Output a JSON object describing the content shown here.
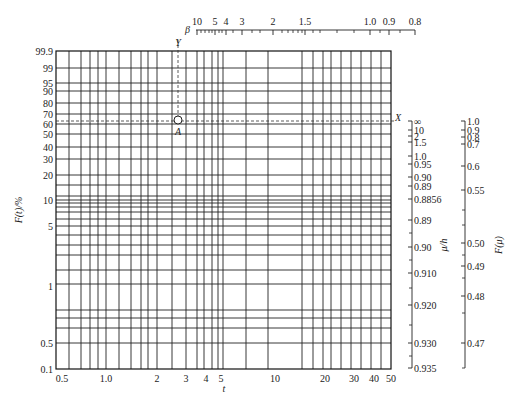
{
  "chart_data": {
    "type": "weibull_probability_paper",
    "title": "",
    "plot_area": {
      "left": 56,
      "right": 391,
      "top": 51,
      "bottom": 369
    },
    "xlabel": "t",
    "ylabel": "F(t)/%",
    "x_axis": {
      "scale": "log",
      "range": [
        0.5,
        50
      ],
      "tick_labels": [
        {
          "label": "0.5",
          "x": 62
        },
        {
          "label": "1.0",
          "x": 106
        },
        {
          "label": "2",
          "x": 157
        },
        {
          "label": "3",
          "x": 186
        },
        {
          "label": "4",
          "x": 206
        },
        {
          "label": "5",
          "x": 221
        },
        {
          "label": "10",
          "x": 275
        },
        {
          "label": "20",
          "x": 325
        },
        {
          "label": "30",
          "x": 354
        },
        {
          "label": "40",
          "x": 374
        },
        {
          "label": "50",
          "x": 391
        }
      ],
      "grid_x": [
        69,
        81,
        90,
        98,
        106,
        119,
        131,
        141,
        148,
        157,
        172,
        186,
        197,
        204,
        212,
        218,
        223,
        246,
        268,
        302,
        313,
        323,
        331,
        341,
        351,
        361,
        371,
        381
      ]
    },
    "y_axis": {
      "scale": "weibull",
      "tick_labels": [
        {
          "label": "99.9",
          "y": 51
        },
        {
          "label": "99",
          "y": 68
        },
        {
          "label": "95",
          "y": 83
        },
        {
          "label": "90",
          "y": 91
        },
        {
          "label": "80",
          "y": 103
        },
        {
          "label": "70",
          "y": 114
        },
        {
          "label": "60",
          "y": 124
        },
        {
          "label": "50",
          "y": 134
        },
        {
          "label": "40",
          "y": 147
        },
        {
          "label": "30",
          "y": 159
        },
        {
          "label": "20",
          "y": 175
        },
        {
          "label": "10",
          "y": 200
        },
        {
          "label": "5",
          "y": 226
        },
        {
          "label": "1",
          "y": 286
        },
        {
          "label": "0.5",
          "y": 343
        },
        {
          "label": "0.1",
          "y": 369
        }
      ],
      "grid_y": [
        68,
        83,
        91,
        103,
        114,
        124,
        134,
        147,
        159,
        175,
        185,
        196,
        200,
        203,
        207,
        212,
        219,
        226,
        235,
        245,
        255,
        270,
        284,
        310,
        318,
        328,
        343
      ]
    },
    "beta_scale": {
      "label": "β",
      "y": 30,
      "x_start": 196,
      "x_end": 415,
      "tick_labels": [
        {
          "label": "10",
          "x": 197
        },
        {
          "label": "5",
          "x": 215
        },
        {
          "label": "4",
          "x": 226
        },
        {
          "label": "3",
          "x": 242
        },
        {
          "label": "2",
          "x": 273
        },
        {
          "label": "1.5",
          "x": 305
        },
        {
          "label": "1.0",
          "x": 370
        },
        {
          "label": "0.9",
          "x": 389
        },
        {
          "label": "0.8",
          "x": 415
        }
      ],
      "minor_ticks": [
        201,
        205,
        209,
        212,
        219,
        222,
        233,
        252,
        260,
        282,
        288,
        293,
        298,
        302,
        313,
        320,
        337,
        354,
        380,
        400
      ]
    },
    "mu_h_scale": {
      "label": "μ/h",
      "x": 412,
      "tick_labels": [
        {
          "label": "∞",
          "y": 121
        },
        {
          "label": "10",
          "y": 130
        },
        {
          "label": "2",
          "y": 136
        },
        {
          "label": "1.5",
          "y": 142
        },
        {
          "label": "1.0",
          "y": 156
        },
        {
          "label": "0.95",
          "y": 164
        },
        {
          "label": "0.90",
          "y": 177
        },
        {
          "label": "0.89",
          "y": 186
        },
        {
          "label": "0.8856",
          "y": 199
        },
        {
          "label": "0.89",
          "y": 220
        },
        {
          "label": "0.90",
          "y": 247
        },
        {
          "label": "0.910",
          "y": 273
        },
        {
          "label": "0.920",
          "y": 305
        },
        {
          "label": "0.930",
          "y": 343
        },
        {
          "label": "0.935",
          "y": 368
        }
      ],
      "minor_ticks": [
        233,
        260,
        288,
        325,
        356
      ]
    },
    "F_mu_scale": {
      "label": "F(μ)",
      "x": 465,
      "tick_labels": [
        {
          "label": "1.0",
          "y": 121
        },
        {
          "label": "0.9",
          "y": 130
        },
        {
          "label": "0.8",
          "y": 137
        },
        {
          "label": "0.7",
          "y": 144
        },
        {
          "label": "0.6",
          "y": 166
        },
        {
          "label": "0.55",
          "y": 190
        },
        {
          "label": "0.50",
          "y": 243
        },
        {
          "label": "0.49",
          "y": 266
        },
        {
          "label": "0.48",
          "y": 296
        },
        {
          "label": "0.47",
          "y": 343
        }
      ],
      "minor_ticks": [
        210,
        225,
        255,
        278,
        313,
        368
      ]
    },
    "annotations": [
      {
        "label": "Y",
        "x": 178,
        "y": 46
      },
      {
        "label": "X",
        "x": 398,
        "y": 121
      },
      {
        "label": "A",
        "x": 178,
        "y": 135
      }
    ],
    "point_A": {
      "x": 178,
      "y": 120
    },
    "dashed_horizontal_y": 121,
    "dashed_vertical_x": 178,
    "grid": true,
    "legend": null,
    "colors": {
      "grid": "#1a1a1a",
      "text": "#222222",
      "background": "#ffffff"
    }
  }
}
